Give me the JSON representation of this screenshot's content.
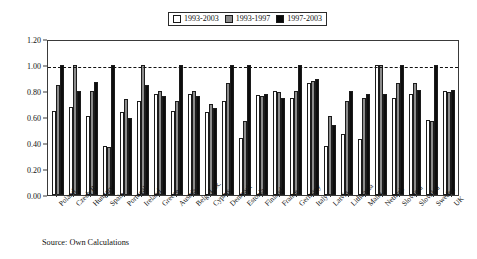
{
  "legend": {
    "entries": [
      {
        "label": "1993-2003",
        "color": "#ffffff",
        "icon": "white-square-icon"
      },
      {
        "label": "1993-1997",
        "color": "#8c8c8c",
        "icon": "gray-square-icon"
      },
      {
        "label": "1997-2003",
        "color": "#0d0d0d",
        "icon": "black-square-icon"
      }
    ]
  },
  "axis": {
    "yticks": [
      "0.00",
      "0.20",
      "0.40",
      "0.60",
      "0.80",
      "1.00",
      "1.20"
    ]
  },
  "source_note": "Source: Own Calculations",
  "chart_data": {
    "type": "bar",
    "title": "",
    "subtitle": "",
    "xlabel": "",
    "ylabel": "",
    "ylim": [
      0.0,
      1.2
    ],
    "ytick_step": 0.2,
    "grid": false,
    "legend_position": "top-center",
    "reference_line": {
      "value": 1.0,
      "style": "dashed",
      "color": "#111111"
    },
    "categories": [
      "Poland",
      "Czech R.",
      "Hungary",
      "Spain",
      "Portugal",
      "Ireland",
      "Greece",
      "Austria",
      "Belg.-Lux.",
      "Cyprus",
      "Denmark",
      "Estonia",
      "Finland",
      "France",
      "Germany",
      "Italy",
      "Latvia",
      "Lithuania",
      "Malta",
      "Netherl.",
      "Slovenia",
      "Slovakia",
      "Sweden",
      "UK"
    ],
    "series": [
      {
        "name": "1993-2003",
        "color": "#ffffff",
        "values": [
          0.65,
          0.68,
          0.61,
          0.38,
          0.64,
          0.72,
          0.78,
          0.65,
          0.78,
          0.64,
          0.72,
          0.44,
          0.77,
          0.8,
          0.75,
          0.86,
          0.38,
          0.47,
          0.43,
          1.0,
          0.75,
          0.78,
          0.58,
          0.8
        ]
      },
      {
        "name": "1993-1997",
        "color": "#8c8c8c",
        "values": [
          0.85,
          1.0,
          0.8,
          0.37,
          0.74,
          1.0,
          0.8,
          0.72,
          0.8,
          0.7,
          0.86,
          0.57,
          0.76,
          0.79,
          0.8,
          0.88,
          0.61,
          0.72,
          0.75,
          1.0,
          0.86,
          0.86,
          0.57,
          0.79
        ]
      },
      {
        "name": "1997-2003",
        "color": "#0d0d0d",
        "values": [
          1.0,
          0.8,
          0.87,
          1.0,
          0.59,
          0.85,
          0.76,
          1.0,
          0.76,
          0.67,
          1.0,
          1.0,
          0.78,
          0.75,
          1.0,
          0.89,
          0.54,
          0.8,
          0.78,
          0.78,
          1.0,
          0.81,
          1.0,
          0.81
        ]
      }
    ]
  }
}
